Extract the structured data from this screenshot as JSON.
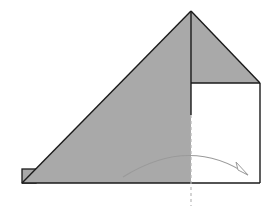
{
  "diagram": {
    "type": "origami-fold-step",
    "colors": {
      "paper_colored": "#a9a9a9",
      "paper_white": "#ffffff",
      "outline": "#1a1a1a",
      "arrow": "#9a9a9a",
      "fold_line": "#b8b8b8"
    },
    "elements": [
      {
        "name": "large-colored-triangle",
        "desc": "left colored triangle face"
      },
      {
        "name": "upper-right-colored-triangle",
        "desc": "small colored triangle above square"
      },
      {
        "name": "white-square-flap",
        "desc": "white square region at right"
      },
      {
        "name": "small-corner-flap",
        "desc": "small flap at bottom-left corner"
      },
      {
        "name": "valley-fold-line",
        "desc": "dashed vertical fold line"
      },
      {
        "name": "fold-arrow",
        "desc": "curved arrow indicating fold to the right"
      }
    ]
  }
}
